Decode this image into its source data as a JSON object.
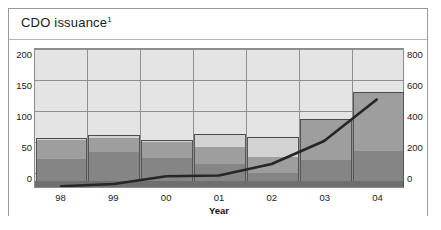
{
  "panel": {
    "title": "CDO issuance",
    "title_footnote": "1"
  },
  "axes": {
    "left_ticks": [
      "200",
      "150",
      "100",
      "50",
      "0"
    ],
    "right_ticks": [
      "800",
      "600",
      "400",
      "200",
      "0"
    ],
    "x_ticks": [
      "98",
      "99",
      "00",
      "01",
      "02",
      "03",
      "04"
    ],
    "x_title": "Year"
  },
  "colors": {
    "plot_background": "#e4e4e4",
    "gridline": "#8f8f8f",
    "frame": "#9a9a9a",
    "bar_lower": "#858585",
    "bar_upper": "#9e9e9e",
    "bar_top_sliver": "#d2d2d2",
    "line": "#262626",
    "base_band": "#6e6e6e",
    "text": "#1a1a1a"
  },
  "chart_data": {
    "type": "bar",
    "title": "CDO issuance",
    "xlabel": "Year",
    "ylabel": "",
    "categories": [
      "98",
      "99",
      "00",
      "01",
      "02",
      "03",
      "04"
    ],
    "left_axis": {
      "ylim": [
        0,
        225
      ],
      "ticks": [
        0,
        50,
        100,
        150,
        200
      ],
      "grid": true
    },
    "right_axis": {
      "ylim": [
        0,
        900
      ],
      "ticks": [
        0,
        200,
        400,
        600,
        800
      ]
    },
    "series": [
      {
        "name": "lower segment",
        "axis": "left",
        "kind": "bar-stacked",
        "values": [
          45,
          57,
          47,
          37,
          22,
          43,
          58
        ]
      },
      {
        "name": "upper segment",
        "axis": "left",
        "kind": "bar-stacked",
        "values": [
          30,
          22,
          26,
          28,
          26,
          67,
          94
        ]
      },
      {
        "name": "top sliver",
        "axis": "left",
        "kind": "bar-stacked",
        "values": [
          4,
          4,
          3,
          20,
          32,
          0,
          0
        ]
      },
      {
        "name": "total bar height",
        "axis": "left",
        "kind": "bar-total",
        "values": [
          79,
          83,
          76,
          85,
          80,
          110,
          152
        ]
      },
      {
        "name": "issuance line",
        "axis": "right",
        "kind": "line",
        "values": [
          5,
          20,
          70,
          75,
          150,
          300,
          570
        ]
      }
    ],
    "legend": {
      "entries": [],
      "position": "none"
    }
  }
}
